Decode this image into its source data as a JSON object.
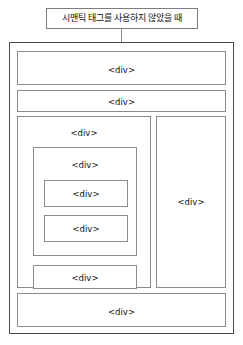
{
  "diagram": {
    "caption": "시맨틱 태그를 사용하지 않았을 때",
    "colors": {
      "background": "#ffffff",
      "caption_border": "#7d7d7d",
      "outer_frame_border": "#4a4a4a",
      "box_border": "#8c8c8c",
      "connector": "#8a8a8a",
      "text": "#111111"
    },
    "boxes": {
      "header": {
        "label": "<div>"
      },
      "nav": {
        "label": "<div>"
      },
      "main": {
        "label": "<div>"
      },
      "article": {
        "label": "<div>"
      },
      "section_1": {
        "label": "<div>"
      },
      "section_2": {
        "label": "<div>"
      },
      "main_extra": {
        "label": "<div>"
      },
      "aside": {
        "label": "<div>"
      },
      "footer": {
        "label": "<div>"
      }
    }
  }
}
